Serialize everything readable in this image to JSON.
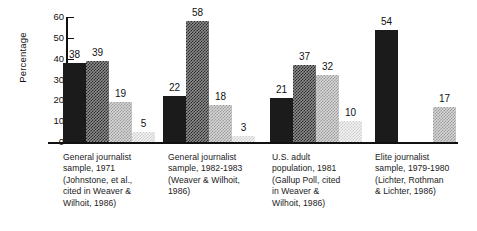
{
  "chart_data": {
    "type": "bar",
    "title": "",
    "xlabel": "",
    "ylabel": "Percentage",
    "ylim": [
      0,
      60
    ],
    "yticks": [
      0,
      10,
      20,
      30,
      40,
      50,
      60
    ],
    "grid": false,
    "legend": "none",
    "categories": [
      "General journalist sample, 1971 (Johnstone, et al., cited in Weaver & Wilhoit, 1986)",
      "General journalist sample, 1982-1983 (Weaver & Wilhoit, 1986)",
      "U.S. adult population, 1981 (Gallup Poll, cited in Weaver & Wilhoit, 1986)",
      "Elite journalist sample, 1979-1980 (Lichter, Rothman & Lichter, 1986)"
    ],
    "series": [
      {
        "name": "series-1",
        "fill": "solid-black",
        "values": [
          38,
          22,
          21,
          54
        ]
      },
      {
        "name": "series-2",
        "fill": "dark-gray-dither",
        "values": [
          39,
          58,
          37,
          17
        ]
      },
      {
        "name": "series-3",
        "fill": "mid-gray-dither",
        "values": [
          19,
          18,
          32,
          null
        ]
      },
      {
        "name": "series-4",
        "fill": "light-gray-dither",
        "values": [
          5,
          3,
          10,
          null
        ]
      }
    ],
    "bars": [
      {
        "group": 0,
        "series": 0,
        "value": 38,
        "label": "38",
        "fill": "solid"
      },
      {
        "group": 0,
        "series": 1,
        "value": 39,
        "label": "39",
        "fill": "dark"
      },
      {
        "group": 0,
        "series": 2,
        "value": 19,
        "label": "19",
        "fill": "mid"
      },
      {
        "group": 0,
        "series": 3,
        "value": 5,
        "label": "5",
        "fill": "light"
      },
      {
        "group": 1,
        "series": 0,
        "value": 22,
        "label": "22",
        "fill": "solid"
      },
      {
        "group": 1,
        "series": 1,
        "value": 58,
        "label": "58",
        "fill": "dark"
      },
      {
        "group": 1,
        "series": 2,
        "value": 18,
        "label": "18",
        "fill": "mid"
      },
      {
        "group": 1,
        "series": 3,
        "value": 3,
        "label": "3",
        "fill": "light"
      },
      {
        "group": 2,
        "series": 0,
        "value": 21,
        "label": "21",
        "fill": "solid"
      },
      {
        "group": 2,
        "series": 1,
        "value": 37,
        "label": "37",
        "fill": "dark"
      },
      {
        "group": 2,
        "series": 2,
        "value": 32,
        "label": "32",
        "fill": "mid"
      },
      {
        "group": 2,
        "series": 3,
        "value": 10,
        "label": "10",
        "fill": "light"
      },
      {
        "group": 3,
        "series": 0,
        "value": 54,
        "label": "54",
        "fill": "solid"
      },
      {
        "group": 3,
        "series": 1,
        "value": 17,
        "label": "17",
        "fill": "mid"
      }
    ]
  },
  "axis": {
    "ylabel": "Percentage",
    "tick_labels": [
      "60",
      "50",
      "40",
      "30",
      "20",
      "10",
      "0"
    ]
  },
  "captions": [
    {
      "lines": [
        "General journalist",
        "sample, 1971",
        "(Johnstone, et al.,",
        "cited in Weaver &",
        "Wilhoit, 1986)"
      ]
    },
    {
      "lines": [
        "General journalist",
        "sample, 1982-1983",
        "(Weaver &  Wilhoit,",
        "1986)"
      ]
    },
    {
      "lines": [
        "U.S. adult",
        "population, 1981",
        "(Gallup Poll, cited",
        "in Weaver &",
        "Wilhoit, 1986)"
      ]
    },
    {
      "lines": [
        "Elite journalist",
        "sample, 1979-1980",
        "(Lichter, Rothman",
        "& Lichter, 1986)"
      ]
    }
  ],
  "colors": {
    "ink": "#1a1a1a",
    "solid": "#1b1b1b",
    "dark": "#5a5a5a",
    "mid": "#b4b4b4",
    "light": "#e4e4e4",
    "background": "#ffffff"
  }
}
